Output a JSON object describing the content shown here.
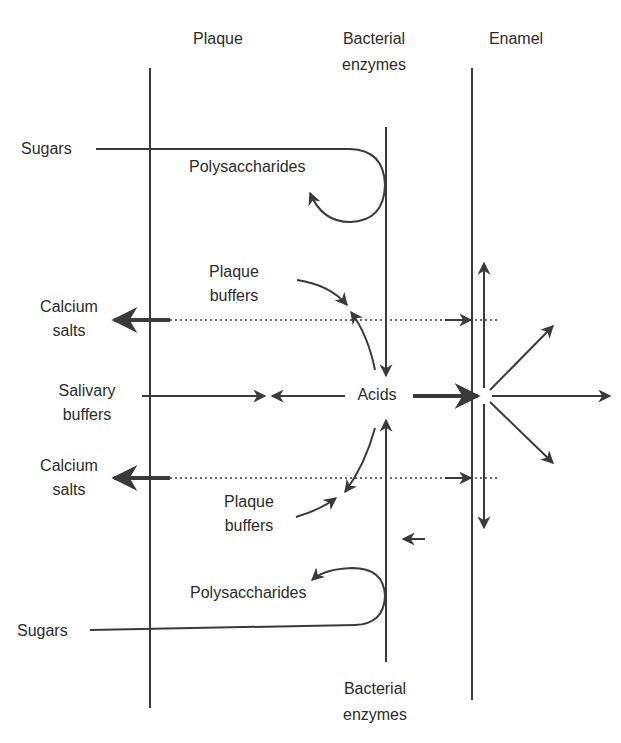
{
  "diagram": {
    "colors": {
      "line": "#3a3a3a",
      "text": "#2b2b2b",
      "background": "#ffffff"
    },
    "columns": {
      "plaque": "Plaque",
      "bacterial_enzymes_top_1": "Bacterial",
      "bacterial_enzymes_top_2": "enzymes",
      "enamel": "Enamel",
      "bacterial_enzymes_bottom_1": "Bacterial",
      "bacterial_enzymes_bottom_2": "enzymes"
    },
    "labels": {
      "sugars_top": "Sugars",
      "polysaccharides_top": "Polysaccharides",
      "plaque_buffers_top_1": "Plaque",
      "plaque_buffers_top_2": "buffers",
      "calcium_salts_top_1": "Calcium",
      "calcium_salts_top_2": "salts",
      "salivary_buffers_1": "Salivary",
      "salivary_buffers_2": "buffers",
      "acids": "Acids",
      "calcium_salts_bottom_1": "Calcium",
      "calcium_salts_bottom_2": "salts",
      "plaque_buffers_bottom_1": "Plaque",
      "plaque_buffers_bottom_2": "buffers",
      "polysaccharides_bottom": "Polysaccharides",
      "sugars_bottom": "Sugars"
    }
  }
}
